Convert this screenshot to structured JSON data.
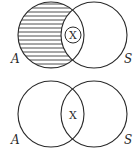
{
  "diagrams": [
    {
      "id": "top",
      "set_left_label": "A",
      "set_right_label": "S",
      "shaded_region": "A only (A minus S)",
      "intersection_marker": "X",
      "marker_circled": true
    },
    {
      "id": "bottom",
      "set_left_label": "A",
      "set_right_label": "S",
      "shaded_region": "none",
      "intersection_marker": "X",
      "marker_circled": false
    }
  ]
}
